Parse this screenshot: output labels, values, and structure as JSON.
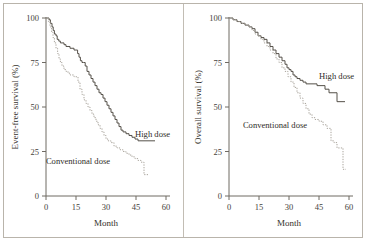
{
  "figure": {
    "caption": "",
    "panel_count": 2,
    "colors": {
      "high_dose": "#555049",
      "conventional_dose": "#a9a49c",
      "axis": "#6f6a63",
      "frame": "#b9b4ab",
      "background": "#ffffff"
    }
  },
  "chart_data": [
    {
      "type": "line",
      "panel": "left",
      "title": "",
      "xlabel": "Month",
      "ylabel": "Event-free survival (%)",
      "xlim": [
        0,
        60
      ],
      "ylim": [
        0,
        100
      ],
      "xticks": [
        0,
        15,
        30,
        45,
        60
      ],
      "yticks": [
        0,
        25,
        50,
        75,
        100
      ],
      "grid": false,
      "legend": "inline-annotation",
      "series": [
        {
          "name": "High dose",
          "style": "solid",
          "label_x": 44.5,
          "label_y": 33,
          "x": [
            0,
            1.5,
            2.2,
            3.0,
            3.6,
            4.2,
            5.0,
            5.6,
            6.4,
            7.2,
            8.0,
            9.0,
            10.0,
            11.0,
            12.0,
            13.0,
            14.0,
            15.0,
            15.8,
            16.5,
            17.2,
            18.0,
            18.8,
            19.6,
            20.5,
            21.5,
            22.5,
            23.5,
            24.5,
            25.5,
            26.5,
            27.5,
            28.5,
            29.5,
            30.5,
            31.5,
            32.5,
            33.5,
            34.5,
            35.5,
            36.5,
            37.5,
            38.5,
            40.0,
            41.5,
            43.0,
            44.5,
            46.0,
            48.0,
            50.0,
            52.0,
            54.5
          ],
          "y": [
            100,
            99,
            97,
            95,
            93,
            91,
            90,
            88,
            87,
            86,
            86,
            85,
            84,
            84,
            83,
            83,
            82,
            82,
            80,
            78,
            76,
            75,
            75,
            73,
            70,
            68,
            66,
            64,
            62,
            60,
            58,
            57,
            55,
            53,
            51,
            49,
            47,
            45,
            43,
            41,
            39,
            37,
            36,
            35,
            34,
            33,
            32,
            31,
            31,
            31,
            31,
            31
          ]
        },
        {
          "name": "Conventional dose",
          "style": "dotted",
          "label_x": 16,
          "label_y": 18,
          "x": [
            0,
            1.2,
            2.0,
            2.8,
            3.5,
            4.2,
            5.0,
            5.8,
            6.5,
            7.2,
            8.0,
            9.0,
            10.0,
            11.0,
            12.0,
            13.0,
            14.0,
            15.0,
            16.0,
            17.0,
            18.0,
            19.0,
            20.0,
            21.0,
            22.0,
            23.0,
            24.0,
            25.0,
            26.0,
            27.0,
            28.0,
            29.0,
            30.0,
            31.0,
            32.5,
            34.0,
            35.5,
            37.0,
            38.5,
            40.0,
            41.5,
            43.0,
            44.5,
            46.0,
            47.5,
            49.0,
            51.0
          ],
          "y": [
            100,
            98,
            95,
            92,
            89,
            86,
            83,
            80,
            77,
            75,
            73,
            71,
            70,
            69,
            68,
            68,
            67,
            67,
            64,
            60,
            57,
            54,
            52,
            50,
            48,
            46,
            44,
            42,
            40,
            38,
            36,
            34,
            32,
            31,
            30,
            28,
            27,
            26,
            25,
            24,
            23,
            22,
            21,
            20,
            19,
            12,
            12
          ]
        }
      ]
    },
    {
      "type": "line",
      "panel": "right",
      "title": "",
      "xlabel": "Month",
      "ylabel": "Overall survival (%)",
      "xlim": [
        0,
        60
      ],
      "ylim": [
        0,
        100
      ],
      "xticks": [
        0,
        15,
        30,
        45,
        60
      ],
      "yticks": [
        0,
        25,
        50,
        75,
        100
      ],
      "grid": false,
      "legend": "inline-annotation",
      "series": [
        {
          "name": "High dose",
          "style": "solid",
          "label_x": 45,
          "label_y": 66,
          "x": [
            0,
            2.0,
            4.0,
            6.0,
            8.0,
            10.0,
            11.5,
            13.0,
            14.5,
            16.0,
            17.5,
            19.0,
            20.5,
            22.0,
            23.5,
            25.0,
            26.5,
            28.0,
            29.0,
            30.0,
            31.0,
            32.0,
            33.0,
            34.0,
            35.5,
            37.0,
            38.5,
            40.0,
            42.0,
            44.0,
            46.0,
            48.0,
            50.0,
            52.0,
            54.0,
            56.0,
            58.0
          ],
          "y": [
            100,
            99,
            98,
            97,
            96,
            95,
            94,
            92,
            90,
            89,
            88,
            86,
            84,
            82,
            80,
            78,
            76,
            74,
            72,
            71,
            70,
            68,
            67,
            66,
            65,
            64,
            63,
            63,
            63,
            62,
            62,
            60,
            58,
            58,
            53,
            53,
            53
          ]
        },
        {
          "name": "Conventional dose",
          "style": "dotted",
          "label_x": 23,
          "label_y": 38,
          "x": [
            0,
            2.0,
            4.0,
            6.0,
            8.0,
            10.0,
            11.5,
            13.0,
            14.5,
            16.0,
            17.5,
            19.0,
            20.5,
            22.0,
            23.5,
            25.0,
            26.5,
            28.0,
            29.5,
            31.0,
            32.5,
            34.0,
            35.5,
            37.0,
            38.5,
            40.0,
            41.5,
            43.0,
            45.0,
            47.0,
            49.0,
            51.0,
            52.5,
            54.0,
            55.5,
            57.0,
            58.5
          ],
          "y": [
            100,
            99,
            98,
            97,
            96,
            95,
            93,
            91,
            90,
            88,
            86,
            84,
            82,
            80,
            77,
            75,
            72,
            70,
            67,
            64,
            61,
            58,
            55,
            52,
            49,
            46,
            44,
            43,
            42,
            40,
            38,
            31,
            30,
            27,
            27,
            15,
            15
          ]
        }
      ]
    }
  ]
}
